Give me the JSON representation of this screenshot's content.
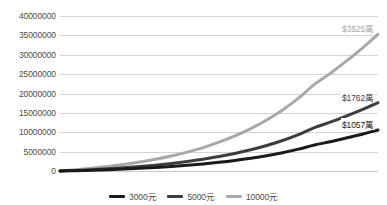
{
  "chart_data": {
    "type": "line",
    "title": "",
    "xlabel": "",
    "ylabel": "",
    "ylim": [
      0,
      40000000
    ],
    "xlim": [
      0,
      40
    ],
    "grid": true,
    "legend_position": "bottom",
    "ytick_labels": [
      "40000000",
      "35000000",
      "30000000",
      "25000000",
      "20000000",
      "15000000",
      "10000000",
      "5000000",
      "0"
    ],
    "ytick_values": [
      40000000,
      35000000,
      30000000,
      25000000,
      20000000,
      15000000,
      10000000,
      5000000,
      0
    ],
    "x": [
      0,
      2,
      4,
      6,
      8,
      10,
      12,
      14,
      16,
      18,
      20,
      22,
      24,
      26,
      28,
      30,
      32,
      34,
      36,
      38,
      40
    ],
    "series": [
      {
        "name": "3000元",
        "color": "#1a1a1a",
        "end_label": "$1057萬",
        "end_value": 10570000,
        "values": [
          0,
          95000,
          210000,
          345000,
          505000,
          690000,
          910000,
          1165000,
          1465000,
          1815000,
          2230000,
          2715000,
          3285000,
          3950000,
          4730000,
          5640000,
          6700000,
          7560000,
          8500000,
          9500000,
          10570000
        ]
      },
      {
        "name": "5000元",
        "color": "#3d3d3d",
        "end_label": "$1762萬",
        "end_value": 17620000,
        "values": [
          0,
          158000,
          350000,
          575000,
          840000,
          1150000,
          1515000,
          1940000,
          2440000,
          3025000,
          3715000,
          4525000,
          5475000,
          6585000,
          7880000,
          9400000,
          11170000,
          12600000,
          14170000,
          15830000,
          17620000
        ]
      },
      {
        "name": "10000元",
        "color": "#a8a8a8",
        "end_label": "$3525萬",
        "end_value": 35250000,
        "values": [
          0,
          316000,
          700000,
          1150000,
          1680000,
          2300000,
          3030000,
          3880000,
          4880000,
          6050000,
          7430000,
          9050000,
          10950000,
          13170000,
          15760000,
          18800000,
          22340000,
          25200000,
          28340000,
          31660000,
          35250000
        ]
      }
    ],
    "legend": [
      {
        "label": "3000元",
        "color": "#1a1a1a"
      },
      {
        "label": "5000元",
        "color": "#3d3d3d"
      },
      {
        "label": "10000元",
        "color": "#a8a8a8"
      }
    ]
  }
}
